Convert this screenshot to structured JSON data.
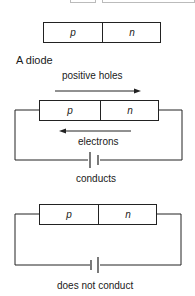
{
  "title": "A diode",
  "junction": {
    "p_label": "p",
    "n_label": "n"
  },
  "circuits": [
    {
      "id": "forward",
      "p_label": "p",
      "n_label": "n",
      "arrow_top_label": "positive holes",
      "arrow_top_direction": "right",
      "arrow_bottom_label": "electrons",
      "arrow_bottom_direction": "left",
      "caption": "conducts",
      "battery_orientation": "long plate left"
    },
    {
      "id": "reverse",
      "p_label": "p",
      "n_label": "n",
      "caption": "does not conduct",
      "battery_orientation": "long plate right"
    }
  ],
  "colors": {
    "line": "#222222",
    "background": "#ffffff"
  }
}
